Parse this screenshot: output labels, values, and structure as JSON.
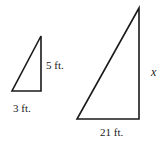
{
  "diagram": {
    "type": "similar-right-triangles",
    "small_triangle": {
      "vertical_side_label": "5 ft.",
      "horizontal_side_label": "3 ft."
    },
    "large_triangle": {
      "vertical_side_label": "x",
      "horizontal_side_label": "21 ft."
    },
    "stroke_color": "#1a1a1a",
    "background_color": "#ffffff"
  }
}
